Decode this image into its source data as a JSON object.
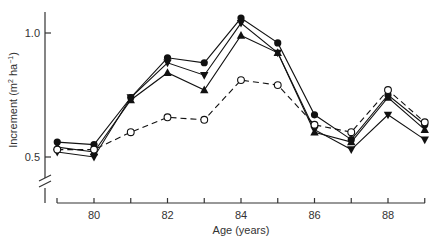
{
  "chart_data": {
    "type": "line",
    "title": "",
    "xlabel": "Age (years)",
    "ylabel": "Increment (m² ha⁻¹)",
    "ylabel_main": "Increment (m",
    "ylabel_sup1": "2",
    "ylabel_mid": " ha",
    "ylabel_sup2": "−1",
    "ylabel_end": ")",
    "xlim": [
      79,
      89
    ],
    "ylim": [
      0.5,
      1.1
    ],
    "y_axis_break": true,
    "grid": false,
    "legend": "none",
    "x_ticks": [
      80,
      81,
      82,
      83,
      84,
      85,
      86,
      87,
      88,
      89
    ],
    "x_tick_labels": [
      "80",
      "82",
      "84",
      "86",
      "88"
    ],
    "y_tick_labels": [
      "0.5",
      "1.0"
    ],
    "x": [
      79,
      80,
      81,
      82,
      83,
      84,
      85,
      86,
      87,
      88,
      89
    ],
    "series": [
      {
        "name": "filled-circle",
        "marker": "circle-filled",
        "line": "solid",
        "values": [
          0.56,
          0.55,
          0.74,
          0.9,
          0.88,
          1.06,
          0.96,
          0.67,
          0.57,
          0.75,
          0.63
        ]
      },
      {
        "name": "filled-triangle-down",
        "marker": "triangle-down-filled",
        "line": "solid",
        "values": [
          0.52,
          0.5,
          0.74,
          0.88,
          0.83,
          1.04,
          0.92,
          0.61,
          0.53,
          0.67,
          0.57
        ]
      },
      {
        "name": "filled-triangle-up",
        "marker": "triangle-up-filled",
        "line": "solid",
        "values": [
          0.54,
          0.52,
          0.73,
          0.84,
          0.77,
          0.99,
          0.92,
          0.6,
          0.56,
          0.74,
          0.61
        ]
      },
      {
        "name": "open-circle",
        "marker": "circle-open",
        "line": "dashed",
        "values": [
          0.53,
          0.53,
          0.6,
          0.66,
          0.65,
          0.81,
          0.79,
          0.63,
          0.6,
          0.77,
          0.64
        ]
      }
    ]
  }
}
